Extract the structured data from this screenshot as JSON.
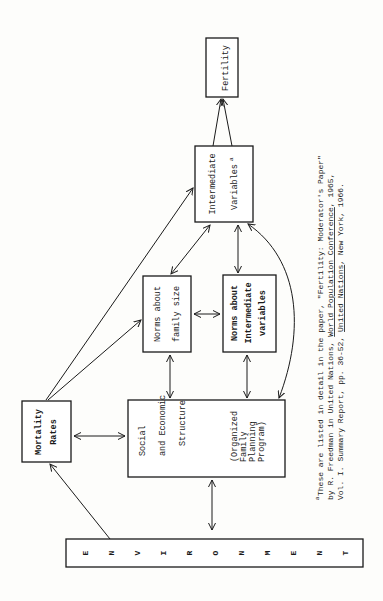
{
  "diagram": {
    "orientation": "rotated 90 degrees counter-clockwise",
    "nodes": {
      "environment": {
        "letters": [
          "E",
          "N",
          "V",
          "I",
          "R",
          "O",
          "N",
          "M",
          "E",
          "N",
          "T"
        ]
      },
      "mortality": {
        "lines": [
          "Mortality",
          "Rates"
        ]
      },
      "social": {
        "lines": [
          "Social",
          "and Economic",
          "Structure"
        ],
        "sub_lines": [
          "(Organized",
          "Family",
          "Planning",
          "Program)"
        ]
      },
      "norms_family": {
        "lines": [
          "Norms about",
          "family size"
        ]
      },
      "norms_intermediate": {
        "lines": [
          "Norms about",
          "Intermediate",
          "variables"
        ]
      },
      "intermediate": {
        "lines": [
          "Intermediate",
          "Variables"
        ],
        "superscript": "a"
      },
      "fertility": {
        "lines": [
          "Fertility"
        ]
      }
    },
    "edges": [
      {
        "from": "environment",
        "to": "mortality",
        "type": "directed"
      },
      {
        "from": "environment",
        "to": "social",
        "type": "bidirectional"
      },
      {
        "from": "mortality",
        "to": "social",
        "type": "bidirectional"
      },
      {
        "from": "mortality",
        "to": "norms_family",
        "type": "directed"
      },
      {
        "from": "mortality",
        "to": "intermediate",
        "type": "directed"
      },
      {
        "from": "social",
        "to": "norms_family",
        "type": "bidirectional"
      },
      {
        "from": "social",
        "to": "norms_intermediate",
        "type": "bidirectional"
      },
      {
        "from": "social",
        "to": "intermediate",
        "type": "bidirectional-curved"
      },
      {
        "from": "norms_family",
        "to": "norms_intermediate",
        "type": "bidirectional"
      },
      {
        "from": "norms_family",
        "to": "intermediate",
        "type": "bidirectional"
      },
      {
        "from": "norms_intermediate",
        "to": "intermediate",
        "type": "bidirectional"
      },
      {
        "from": "intermediate",
        "to": "fertility",
        "type": "directed-double"
      }
    ]
  },
  "footnote": {
    "marker": "a",
    "line1": "These are listed in detail in the paper, \"Fertility: Moderator's Paper\"",
    "line2_pre": "by R. Freedman in United Nations, ",
    "line2_underlined": "World Population Conference",
    "line2_post": ", 1965,",
    "line3_pre": "Vol. I. Summary Report, pp. 36-52, ",
    "line3_underlined": "United Nations",
    "line3_post": ", New York, 1966."
  }
}
